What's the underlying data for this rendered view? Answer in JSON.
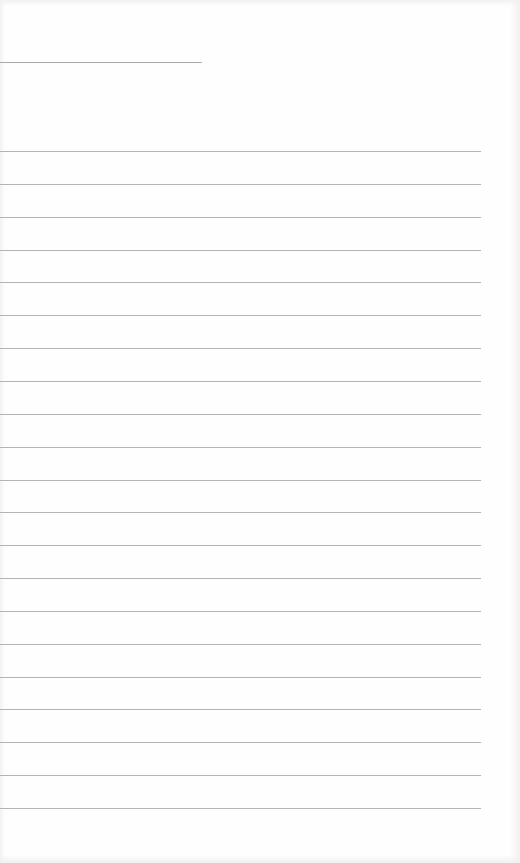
{
  "page": {
    "type": "lined-paper",
    "background_color": "#fefefe",
    "rule_color": "#b4b4b4",
    "header_line": {
      "x": 0,
      "y": 62,
      "width": 202
    },
    "ruled_lines": {
      "count": 21,
      "first_y": 151,
      "spacing": 32.85,
      "x": 0,
      "width": 481
    },
    "text": []
  }
}
